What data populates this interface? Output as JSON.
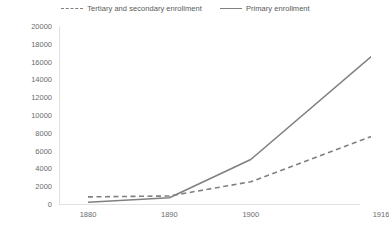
{
  "chart_data": {
    "type": "line",
    "title": "",
    "subtitle": "",
    "xlabel": "",
    "ylabel": "",
    "categories": [
      "1880",
      "1890",
      "1900",
      "1916"
    ],
    "x_tick_labels": [
      "1880",
      "1890",
      "1900",
      "1916"
    ],
    "y_tick_labels": [
      "20000",
      "18000",
      "16000",
      "14000",
      "12000",
      "10000",
      "8000",
      "6000",
      "4000",
      "2000",
      "0"
    ],
    "y_tick_values": [
      20000,
      18000,
      16000,
      14000,
      12000,
      10000,
      8000,
      6000,
      4000,
      2000,
      0
    ],
    "ylim": [
      0,
      20000
    ],
    "grid": false,
    "legend_position": "top-center",
    "series": [
      {
        "name": "Tertiary and secondary enrollment",
        "style": "dashed",
        "color": "#808080",
        "values": [
          800,
          900,
          2500,
          8000
        ]
      },
      {
        "name": "Primary enrollment",
        "style": "solid",
        "color": "#808080",
        "values": [
          200,
          700,
          5000,
          17500
        ]
      }
    ]
  },
  "legend": {
    "entries": [
      {
        "label": "Tertiary and secondary enrollment",
        "style": "dashed"
      },
      {
        "label": "Primary enrollment",
        "style": "solid"
      }
    ]
  },
  "colors": {
    "series_line": "#808080",
    "axis_line": "#d9d9d9",
    "tick_text": "#6b6b6b",
    "legend_text": "#595959",
    "background": "#ffffff"
  }
}
